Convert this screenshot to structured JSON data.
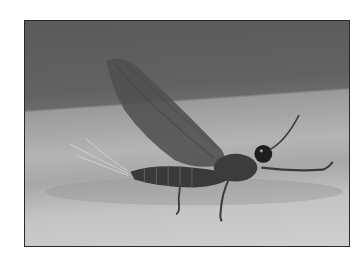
{
  "image": {
    "subject": "mayfly",
    "description": "Grayscale photograph of a mayfly resting on a pale surface, wings raised, long tail filaments trailing left",
    "colors": {
      "background_top": "#5e5e5e",
      "background_bottom": "#c8c8c8",
      "wing": "#4f4f4f",
      "body": "#3a3a3a",
      "frame_border": "#2a2a2a",
      "page": "#ffffff"
    }
  }
}
